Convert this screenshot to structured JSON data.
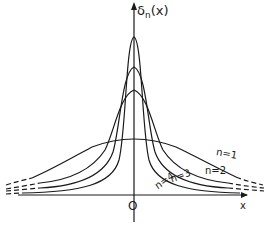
{
  "figure": {
    "y_axis_label": "δn(x)",
    "y_axis_label_main": "δ",
    "y_axis_label_sub": "n",
    "y_axis_label_arg": "(x)",
    "x_axis_label": "x",
    "origin_label": "O"
  },
  "curves": [
    {
      "label": "n=1",
      "n": 1,
      "peak_px_y": 139
    },
    {
      "label": "n=2",
      "n": 2,
      "peak_px_y": 90
    },
    {
      "label": "n=3",
      "n": 3,
      "peak_px_y": 67
    },
    {
      "label": "n=4",
      "n": 4,
      "peak_px_y": 37
    }
  ],
  "colors": {
    "ink": "#1a1a1a",
    "background": "#ffffff"
  }
}
